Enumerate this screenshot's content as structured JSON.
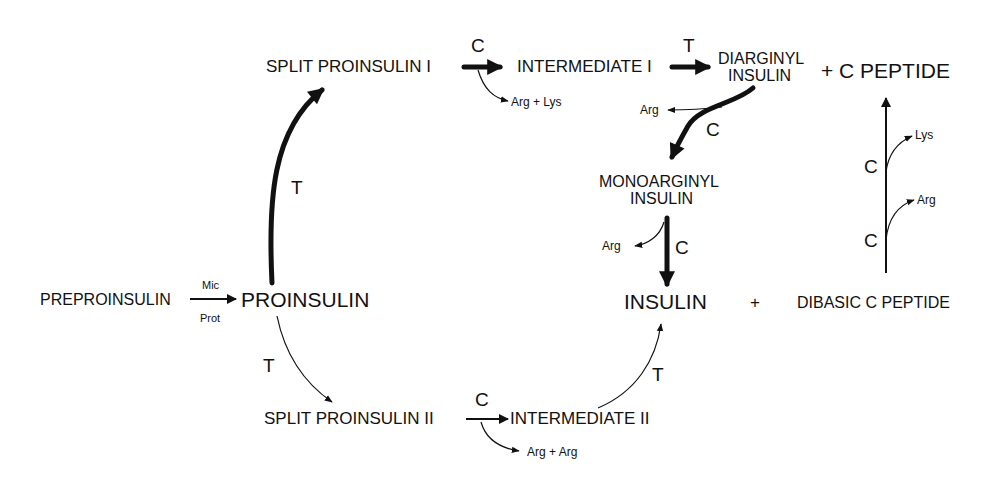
{
  "diagram": {
    "nodes": {
      "preproinsulin": "PREPROINSULIN",
      "proinsulin": "PROINSULIN",
      "split_proinsulin_1": "SPLIT PROINSULIN I",
      "intermediate_1": "INTERMEDIATE I",
      "diarginyl_line1": "DIARGINYL",
      "diarginyl_line2": "INSULIN",
      "plus_c_peptide": "+ C PEPTIDE",
      "monoarginyl_line1": "MONOARGINYL",
      "monoarginyl_line2": "INSULIN",
      "insulin": "INSULIN",
      "plus": "+",
      "dibasic_c_peptide": "DIBASIC C PEPTIDE",
      "split_proinsulin_2": "SPLIT PROINSULIN II",
      "intermediate_2": "INTERMEDIATE II"
    },
    "enzymes": {
      "mic": "Mic",
      "prot": "Prot",
      "t_upper": "T",
      "t_lower": "T",
      "c_split1": "C",
      "t_inter1": "T",
      "c_diarginyl": "C",
      "c_monoarginyl": "C",
      "c_split2": "C",
      "t_inter2": "T",
      "c_peptide_upper": "C",
      "c_peptide_lower": "C"
    },
    "byproducts": {
      "arg_lys": "Arg + Lys",
      "arg_diarginyl": "Arg",
      "arg_monoarginyl": "Arg",
      "arg_arg": "Arg + Arg",
      "lys_peptide": "Lys",
      "arg_peptide": "Arg"
    }
  }
}
